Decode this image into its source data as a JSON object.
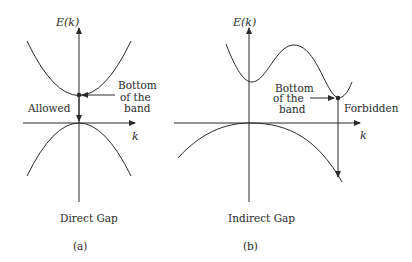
{
  "panels": [
    {
      "id": "a",
      "caption": "(a)",
      "title": "Direct Gap",
      "y_axis_label": "E(k)",
      "x_axis_label": "k",
      "annotation": [
        "Bottom",
        "of the",
        "band"
      ],
      "region_label": "Allowed"
    },
    {
      "id": "b",
      "caption": "(b)",
      "title": "Indirect Gap",
      "y_axis_label": "E(k)",
      "x_axis_label": "k",
      "annotation": [
        "Bottom",
        "of the",
        "band"
      ],
      "region_label": "Forbidden"
    }
  ],
  "colors": {
    "line": "#2a2a2a",
    "background": "#ffffff"
  }
}
